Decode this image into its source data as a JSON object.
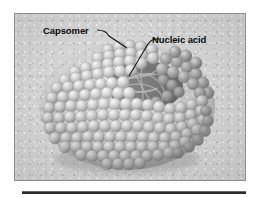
{
  "figure": {
    "alt_title": "Icosahedral virus capsid cutaway diagram",
    "background_color": "#d2d2d2",
    "border_color": "#8d8d8d",
    "labels": [
      {
        "id": "capsomer",
        "text": "Capsomer",
        "leader_icon": "leader-line-icon"
      },
      {
        "id": "nucleic-acid",
        "text": "Nucleic acid",
        "leader_icon": "leader-line-icon"
      }
    ],
    "structure": {
      "capsomer_color": "#b9b9b9",
      "capsomer_highlight_color": "#f2f2f2",
      "capsomer_shadow_color": "#6f6f6f",
      "cavity_color": "#5c5c5c",
      "nucleic_acid_strand_color": "#8e8e8e"
    }
  },
  "divider": {
    "name": "bottom-divider",
    "color": "#2b2b2b"
  }
}
